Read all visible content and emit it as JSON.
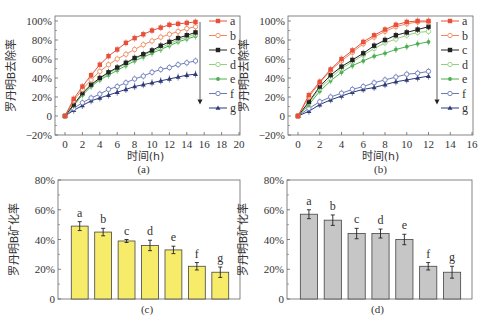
{
  "chart_data": [
    {
      "id": "a",
      "type": "line",
      "caption": "(a)",
      "xlabel": "时间(h)",
      "ylabel": "罗丹明B去除率",
      "xlim": [
        0,
        20
      ],
      "ylim": [
        -20,
        100
      ],
      "xticks": [
        0,
        2,
        4,
        6,
        8,
        10,
        12,
        14,
        16,
        18,
        20
      ],
      "yticks": [
        -20,
        0,
        20,
        40,
        60,
        80,
        100
      ],
      "ytick_labels": [
        "−20%",
        "0",
        "20%",
        "40%",
        "60%",
        "80%",
        "100%"
      ],
      "grid": false,
      "legend_position": "right-inside",
      "legend_arrow": true,
      "x": [
        0,
        1,
        2,
        3,
        4,
        5,
        6,
        7,
        8,
        9,
        10,
        11,
        12,
        13,
        14,
        15
      ],
      "series": [
        {
          "name": "a",
          "color": "#e8503a",
          "marker": "square-filled",
          "values": [
            0,
            18,
            31,
            43,
            54,
            63,
            70,
            77,
            82,
            86,
            90,
            93,
            96,
            97,
            98,
            99
          ]
        },
        {
          "name": "b",
          "color": "#f08a5d",
          "marker": "circle-open",
          "values": [
            0,
            16,
            28,
            38,
            47,
            54,
            60,
            65,
            70,
            75,
            79,
            83,
            86,
            89,
            92,
            94
          ]
        },
        {
          "name": "c",
          "color": "#222222",
          "marker": "square-filled",
          "values": [
            0,
            12,
            24,
            33,
            40,
            46,
            51,
            56,
            61,
            65,
            69,
            74,
            78,
            82,
            85,
            88
          ]
        },
        {
          "name": "d",
          "color": "#8fd17f",
          "marker": "circle-open",
          "values": [
            0,
            12,
            23,
            32,
            39,
            45,
            50,
            55,
            60,
            64,
            68,
            72,
            76,
            80,
            83,
            86
          ]
        },
        {
          "name": "e",
          "color": "#4caf50",
          "marker": "star",
          "values": [
            0,
            11,
            22,
            31,
            38,
            43,
            48,
            53,
            58,
            62,
            66,
            70,
            74,
            78,
            81,
            84
          ]
        },
        {
          "name": "f",
          "color": "#6a7ab8",
          "marker": "circle-open",
          "values": [
            0,
            8,
            14,
            19,
            23,
            28,
            31,
            35,
            39,
            42,
            46,
            49,
            51,
            54,
            56,
            58
          ]
        },
        {
          "name": "g",
          "color": "#2d3a7a",
          "marker": "triangle-filled",
          "values": [
            0,
            6,
            11,
            16,
            19,
            22,
            25,
            28,
            31,
            33,
            35,
            37,
            39,
            41,
            43,
            44
          ]
        }
      ]
    },
    {
      "id": "b",
      "type": "line",
      "caption": "(b)",
      "xlabel": "时间(h)",
      "ylabel": "罗丹明B去除率",
      "xlim": [
        -1,
        16
      ],
      "ylim": [
        -20,
        100
      ],
      "xticks": [
        0,
        2,
        4,
        6,
        8,
        10,
        12,
        14,
        16
      ],
      "yticks": [
        -20,
        0,
        20,
        40,
        60,
        80,
        100
      ],
      "ytick_labels": [
        "−20%",
        "0",
        "20%",
        "40%",
        "60%",
        "80%",
        "100%"
      ],
      "grid": false,
      "legend_position": "right-inside",
      "legend_arrow": true,
      "x": [
        0,
        1,
        2,
        3,
        4,
        5,
        6,
        7,
        8,
        9,
        10,
        11,
        12
      ],
      "series": [
        {
          "name": "a",
          "color": "#e8503a",
          "marker": "square-filled",
          "values": [
            0,
            22,
            36,
            49,
            60,
            69,
            78,
            85,
            91,
            96,
            99,
            100,
            100
          ]
        },
        {
          "name": "b",
          "color": "#f08a5d",
          "marker": "circle-open",
          "values": [
            0,
            20,
            35,
            48,
            58,
            67,
            76,
            83,
            89,
            94,
            97,
            99,
            99
          ]
        },
        {
          "name": "c",
          "color": "#222222",
          "marker": "square-filled",
          "values": [
            0,
            15,
            31,
            43,
            52,
            59,
            66,
            74,
            80,
            85,
            88,
            91,
            94
          ]
        },
        {
          "name": "d",
          "color": "#8fd17f",
          "marker": "circle-open",
          "values": [
            0,
            14,
            29,
            40,
            50,
            57,
            64,
            71,
            77,
            81,
            85,
            88,
            89
          ]
        },
        {
          "name": "e",
          "color": "#4caf50",
          "marker": "star",
          "values": [
            0,
            12,
            26,
            37,
            46,
            53,
            58,
            63,
            66,
            70,
            73,
            76,
            78
          ]
        },
        {
          "name": "f",
          "color": "#6a7ab8",
          "marker": "circle-open",
          "values": [
            0,
            8,
            15,
            20,
            24,
            28,
            31,
            35,
            38,
            41,
            44,
            45,
            47
          ]
        },
        {
          "name": "g",
          "color": "#2d3a7a",
          "marker": "triangle-filled",
          "values": [
            0,
            5,
            12,
            17,
            21,
            25,
            28,
            30,
            33,
            36,
            38,
            40,
            42
          ]
        }
      ]
    },
    {
      "id": "c",
      "type": "bar",
      "caption": "(c)",
      "ylabel": "罗丹明B矿化率",
      "ylim": [
        0,
        80
      ],
      "yticks": [
        0,
        20,
        40,
        60,
        80
      ],
      "ytick_labels": [
        "0",
        "20%",
        "40%",
        "60%",
        "80%"
      ],
      "bar_color": "#f7ec6a",
      "categories": [
        "a",
        "b",
        "c",
        "d",
        "e",
        "f",
        "g"
      ],
      "values": [
        49,
        45,
        39,
        36,
        33,
        22,
        18
      ],
      "errors": [
        3,
        2.5,
        1,
        3.5,
        2.5,
        2.5,
        3.5
      ]
    },
    {
      "id": "d",
      "type": "bar",
      "caption": "(d)",
      "ylabel": "罗丹明B矿化率",
      "ylim": [
        0,
        80
      ],
      "yticks": [
        0,
        20,
        40,
        60,
        80
      ],
      "ytick_labels": [
        "0",
        "20%",
        "40%",
        "60%",
        "80%"
      ],
      "bar_color": "#c6c6c6",
      "categories": [
        "a",
        "b",
        "c",
        "d",
        "e",
        "f",
        "g"
      ],
      "values": [
        57,
        53,
        44,
        44,
        40,
        22,
        18
      ],
      "errors": [
        3,
        3.5,
        3.5,
        3,
        3.5,
        2.5,
        4
      ]
    }
  ],
  "layout": {
    "panels": {
      "a": {
        "left": 55,
        "right": 240,
        "top": 16,
        "bottom": 135,
        "x0px": 65,
        "x1px": 239,
        "legend_x": 205,
        "legend_y0": 19,
        "legend_dy": 14.5,
        "arrow_x": 200
      },
      "b": {
        "left": 288,
        "right": 473,
        "top": 16,
        "bottom": 135,
        "x0px": 298,
        "x1px": 472,
        "legend_x": 437,
        "legend_y0": 19,
        "legend_dy": 14.5,
        "arrow_x": 437
      },
      "c": {
        "left": 58,
        "right": 240,
        "top": 180,
        "bottom": 299
      },
      "d": {
        "left": 287,
        "right": 472,
        "top": 180,
        "bottom": 299
      }
    }
  }
}
